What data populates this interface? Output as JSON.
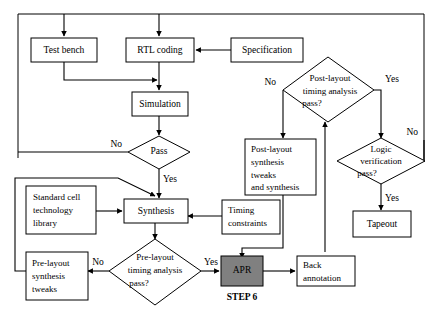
{
  "diagram": {
    "colors": {
      "background": "#ffffff",
      "stroke": "#000000",
      "node_fill": "#ffffff",
      "highlight_fill": "#808080"
    },
    "nodes": [
      {
        "id": "test_bench",
        "type": "process",
        "label": "Test bench"
      },
      {
        "id": "rtl_coding",
        "type": "process",
        "label": "RTL coding"
      },
      {
        "id": "specification",
        "type": "process",
        "label": "Specification"
      },
      {
        "id": "simulation",
        "type": "process",
        "label": "Simulation"
      },
      {
        "id": "pass",
        "type": "decision",
        "label": "Pass"
      },
      {
        "id": "standard_cell_library",
        "type": "process",
        "label_lines": [
          "Standard cell",
          "technology",
          "library"
        ]
      },
      {
        "id": "synthesis",
        "type": "process",
        "label": "Synthesis"
      },
      {
        "id": "prelayout_tweaks",
        "type": "process",
        "label_lines": [
          "Pre-layout",
          "synthesis",
          "tweaks"
        ]
      },
      {
        "id": "prelayout_timing",
        "type": "decision",
        "label_lines": [
          "Pre-layout",
          "timing analysis",
          "pass?"
        ]
      },
      {
        "id": "timing_constraints",
        "type": "process",
        "label_lines": [
          "Timing",
          "constraints"
        ]
      },
      {
        "id": "apr",
        "type": "process-highlight",
        "label": "APR",
        "step_label": "STEP 6"
      },
      {
        "id": "back_annotation",
        "type": "process",
        "label_lines": [
          "Back",
          "annotation"
        ]
      },
      {
        "id": "postlayout_synthesis",
        "type": "process",
        "label_lines": [
          "Post-layout",
          "synthesis",
          "tweaks",
          "and synthesis"
        ]
      },
      {
        "id": "postlayout_timing",
        "type": "decision",
        "label_lines": [
          "Post-layout",
          "timing analysis",
          "pass?"
        ]
      },
      {
        "id": "logic_verification",
        "type": "decision",
        "label_lines": [
          "Logic",
          "verification",
          "pass?"
        ]
      },
      {
        "id": "tapeout",
        "type": "process",
        "label": "Tapeout"
      }
    ],
    "edge_labels": {
      "pass_no": "No",
      "pass_yes": "Yes",
      "prelayout_no": "No",
      "prelayout_yes": "Yes",
      "postlayout_no": "No",
      "postlayout_yes": "Yes",
      "logic_no": "No",
      "logic_yes": "Yes"
    },
    "labels": {
      "test_bench": "Test bench",
      "rtl_coding": "RTL coding",
      "specification": "Specification",
      "simulation": "Simulation",
      "pass": "Pass",
      "std_cell_1": "Standard cell",
      "std_cell_2": "technology",
      "std_cell_3": "library",
      "synthesis": "Synthesis",
      "prelayout_tweaks_1": "Pre-layout",
      "prelayout_tweaks_2": "synthesis",
      "prelayout_tweaks_3": "tweaks",
      "prelayout_timing_1": "Pre-layout",
      "prelayout_timing_2": "timing analysis",
      "prelayout_timing_3": "pass?",
      "timing_constraints_1": "Timing",
      "timing_constraints_2": "constraints",
      "apr": "APR",
      "step6": "STEP 6",
      "back_annotation_1": "Back",
      "back_annotation_2": "annotation",
      "postlayout_synth_1": "Post-layout",
      "postlayout_synth_2": "synthesis",
      "postlayout_synth_3": "tweaks",
      "postlayout_synth_4": "and synthesis",
      "postlayout_timing_1": "Post-layout",
      "postlayout_timing_2": "timing analysis",
      "postlayout_timing_3": "pass?",
      "logic_verif_1": "Logic",
      "logic_verif_2": "verification",
      "logic_verif_3": "pass?",
      "tapeout": "Tapeout"
    }
  }
}
